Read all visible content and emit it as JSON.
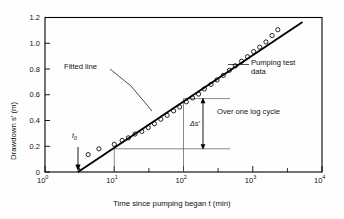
{
  "figure": {
    "kind": "semi-log-drawdown-plot",
    "background": "#fefefe",
    "frame_color": "#000000",
    "data_marker": "open-circle"
  },
  "axes": {
    "x": {
      "title": "Time since pumping began t (min)",
      "scale": "log",
      "min": 1,
      "max": 10000,
      "tick_labels": [
        "10",
        "10",
        "10",
        "10",
        "10"
      ],
      "tick_exponents": [
        "0",
        "1",
        "2",
        "3",
        "4"
      ],
      "tick_values": [
        1,
        10,
        100,
        1000,
        10000
      ],
      "minor_ticks": true
    },
    "y": {
      "title": "Drawdown s′ (m)",
      "scale": "linear",
      "min": 0,
      "max": 1.2,
      "tick_labels": [
        "0",
        "0.2",
        "0.4",
        "0.6",
        "0.8",
        "1.0",
        "1.2"
      ],
      "tick_values": [
        0,
        0.2,
        0.4,
        0.6,
        0.8,
        1.0,
        1.2
      ]
    }
  },
  "annotations": {
    "fitted_line": "Fitted line",
    "pumping_test_data_line1": "Pumping test",
    "pumping_test_data_line2": "data",
    "over_one_log_cycle": "Over one log cycle",
    "delta_s": "Δs′",
    "t_zero": "t",
    "t_zero_sub": "0"
  },
  "chart_data": {
    "type": "scatter",
    "title": "",
    "xlabel": "Time since pumping began t (min)",
    "ylabel": "Drawdown s′ (m)",
    "xscale": "log",
    "xlim": [
      1,
      10000
    ],
    "ylim": [
      0,
      1.2
    ],
    "grid": false,
    "legend": "none",
    "series": [
      {
        "name": "Pumping test data",
        "marker": "open-circle",
        "x": [
          4.2,
          6.0,
          10.0,
          13.0,
          16.0,
          20.0,
          25.0,
          31.0,
          38.0,
          47.0,
          58.0,
          72.0,
          88.0,
          110.0,
          135.0,
          165.0,
          200.0,
          250.0,
          305.0,
          375.0,
          460.0,
          560.0,
          690.0,
          840.0,
          1030.0,
          1260.0,
          1550.0,
          1900.0,
          2300.0
        ],
        "y": [
          0.135,
          0.18,
          0.215,
          0.245,
          0.265,
          0.295,
          0.315,
          0.345,
          0.375,
          0.41,
          0.44,
          0.475,
          0.505,
          0.545,
          0.575,
          0.605,
          0.645,
          0.68,
          0.715,
          0.75,
          0.79,
          0.825,
          0.86,
          0.895,
          0.935,
          0.97,
          1.01,
          1.06,
          1.105
        ]
      },
      {
        "name": "Fitted line",
        "type": "line",
        "x": [
          3.0,
          3000.0
        ],
        "y": [
          0.0,
          1.165
        ]
      }
    ],
    "markers": {
      "t0_value": 3.0,
      "t0_label": "t0",
      "delta_s_label": "Δs′",
      "delta_s_from": 0.18,
      "delta_s_to": 0.57,
      "delta_s_value": 0.39,
      "log_cycle_from_t": 10,
      "log_cycle_to_t": 100
    }
  }
}
